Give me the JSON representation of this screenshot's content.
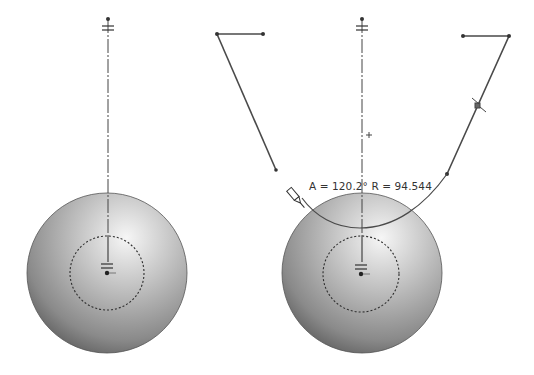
{
  "viewport": {
    "width": 534,
    "height": 375,
    "background": "#ffffff"
  },
  "colors": {
    "sketch_line": "#4a4a4a",
    "centerline": "#555555",
    "sphere_light": "#f4f4f4",
    "sphere_mid": "#a9a9a9",
    "sphere_dark": "#5a5a5a",
    "dashed_circle": "#333333",
    "text": "#333333"
  },
  "left_view": {
    "sphere": {
      "cx": 107,
      "cy": 273,
      "r": 80
    },
    "inner_dashed_circle": {
      "cx": 107,
      "cy": 273,
      "r": 37
    },
    "centerline": {
      "x": 108,
      "y1": 19,
      "y2": 236
    },
    "origin_point": {
      "x": 107,
      "y": 272
    },
    "polyline": [
      [
        217,
        34
      ],
      [
        263,
        34
      ],
      [
        276,
        170
      ]
    ],
    "polyline_corner": [
      217,
      34
    ]
  },
  "right_view": {
    "sphere": {
      "cx": 362,
      "cy": 273,
      "r": 80
    },
    "inner_dashed_circle": {
      "cx": 361,
      "cy": 274,
      "r": 38
    },
    "centerline": {
      "x": 362,
      "y1": 19,
      "y2": 236
    },
    "origin_point": {
      "x": 361,
      "y": 274
    },
    "polyline": [
      [
        463,
        36
      ],
      [
        509,
        36
      ],
      [
        447,
        174
      ]
    ],
    "arc": {
      "start": [
        447,
        174
      ],
      "end": [
        300,
        197
      ]
    },
    "tangent_marker": {
      "x": 478,
      "y": 106
    },
    "pencil_cursor": {
      "x": 298,
      "y": 200
    },
    "crosshair": {
      "x": 369,
      "y": 135
    },
    "dimension_text": "A = 120.2° R = 94.544"
  }
}
